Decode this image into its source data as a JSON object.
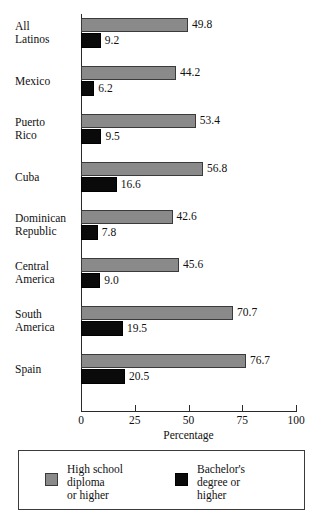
{
  "chart_data": {
    "type": "bar",
    "orientation": "horizontal",
    "title": "",
    "xlabel": "Percentage",
    "ylabel": "",
    "xlim": [
      0,
      100
    ],
    "xticks": [
      0,
      25,
      50,
      75,
      100
    ],
    "xtick_labels": [
      "0",
      "25",
      "50",
      "75",
      "100"
    ],
    "grid": false,
    "legend_position": "bottom",
    "categories": [
      "All\nLatinos",
      "Mexico",
      "Puerto\nRico",
      "Cuba",
      "Dominican\nRepublic",
      "Central\nAmerica",
      "South\nAmerica",
      "Spain"
    ],
    "series": [
      {
        "name": "High school\ndiploma\nor higher",
        "color": "#8a8a8a",
        "values": [
          49.8,
          44.2,
          53.4,
          56.8,
          42.6,
          45.6,
          70.7,
          76.7
        ],
        "value_labels": [
          "49.8",
          "44.2",
          "53.4",
          "56.8",
          "42.6",
          "45.6",
          "70.7",
          "76.7"
        ]
      },
      {
        "name": "Bachelor's\ndegree or\nhigher",
        "color": "#0a0a0a",
        "values": [
          9.2,
          6.2,
          9.5,
          16.6,
          7.8,
          9.0,
          19.5,
          20.5
        ],
        "value_labels": [
          "9.2",
          "6.2",
          "9.5",
          "16.6",
          "7.8",
          "9.0",
          "19.5",
          "20.5"
        ]
      }
    ]
  },
  "legend": {
    "entries": [
      {
        "label": "High school\ndiploma\nor higher",
        "swatch": "gray-swatch"
      },
      {
        "label": "Bachelor's\ndegree or\nhigher",
        "swatch": "black-swatch"
      }
    ]
  }
}
